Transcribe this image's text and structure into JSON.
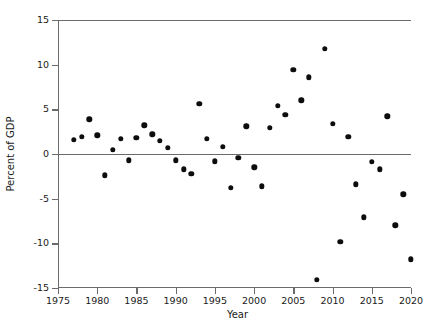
{
  "chart_data": {
    "type": "scatter",
    "title": "",
    "xlabel": "Year",
    "ylabel": "Percent of GDP",
    "xlim": [
      1975,
      2020
    ],
    "ylim": [
      -15,
      15
    ],
    "xticks": [
      1975,
      1980,
      1985,
      1990,
      1995,
      2000,
      2005,
      2010,
      2015,
      2020
    ],
    "xtick_labels": [
      "1975",
      "1980",
      "1985",
      "1990",
      "1995",
      "2000",
      "2005",
      "2010",
      "2015",
      "2020"
    ],
    "yticks": [
      -15,
      -10,
      -5,
      0,
      5,
      10,
      15
    ],
    "ytick_labels": [
      "-15",
      "-10",
      "-5",
      "0",
      "5",
      "10",
      "15"
    ],
    "grid": false,
    "legend": false,
    "zero_reference_line": 0,
    "marker": "filled-circle",
    "marker_color": "#0d0d0d",
    "axis_color": "#6b6b6b",
    "series": [
      {
        "name": "Percent of GDP",
        "x": [
          1977,
          1978,
          1979,
          1980,
          1981,
          1982,
          1983,
          1984,
          1985,
          1986,
          1987,
          1988,
          1989,
          1990,
          1991,
          1992,
          1993,
          1994,
          1995,
          1996,
          1997,
          1998,
          1999,
          2000,
          2001,
          2002,
          2003,
          2004,
          2005,
          2006,
          2007,
          2008,
          2009,
          2010,
          2011,
          2012,
          2013,
          2014,
          2015,
          2016,
          2017,
          2018,
          2019,
          2020
        ],
        "y": [
          1.6,
          1.9,
          3.9,
          2.1,
          -2.4,
          0.5,
          1.7,
          -0.7,
          1.8,
          3.2,
          2.2,
          1.5,
          0.7,
          -0.7,
          -1.7,
          -2.2,
          5.6,
          1.7,
          -0.8,
          0.8,
          -3.8,
          -0.4,
          3.1,
          -1.5,
          -3.6,
          2.9,
          5.4,
          4.4,
          9.4,
          6.0,
          8.6,
          -14.1,
          11.8,
          3.4,
          -9.8,
          1.9,
          -3.4,
          -7.1,
          -0.9,
          -1.7,
          4.2,
          -8.0,
          -4.5,
          -11.8
        ]
      }
    ]
  }
}
